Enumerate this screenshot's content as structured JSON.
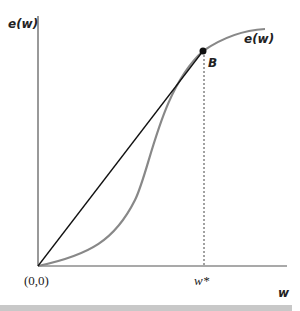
{
  "diagram": {
    "y_axis_label": "e(w)",
    "x_axis_label": "w",
    "curve_label": "e(w)",
    "point_label": "B",
    "origin_label": "(0,0)",
    "x_tick_label": "w*",
    "colors": {
      "curve": "#888888",
      "axes": "#222222",
      "tangent": "#111111"
    }
  }
}
